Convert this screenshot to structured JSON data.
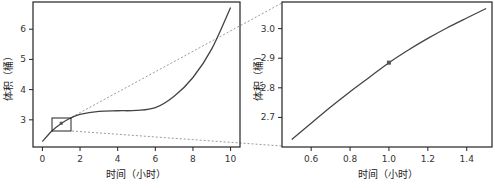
{
  "chart_data": [
    {
      "type": "line",
      "title": "",
      "xlabel": "时间（小时）",
      "ylabel": "体积（桶）",
      "xlim": [
        -0.5,
        10.5
      ],
      "ylim": [
        2.1,
        6.9
      ],
      "xticks": [
        0,
        2,
        4,
        6,
        8,
        10
      ],
      "yticks": [
        3,
        4,
        5,
        6
      ],
      "grid": false,
      "x": [
        0,
        0.5,
        1,
        1.5,
        2,
        3,
        4,
        5,
        6,
        7,
        8,
        9,
        10
      ],
      "y": [
        2.28,
        2.63,
        2.88,
        3.06,
        3.18,
        3.28,
        3.3,
        3.31,
        3.4,
        3.78,
        4.4,
        5.35,
        6.72
      ],
      "highlight_point": {
        "x": 1.0,
        "y": 2.885
      },
      "zoom_box": {
        "x0": 0.5,
        "x1": 1.5,
        "y0": 2.6,
        "y1": 3.08
      }
    },
    {
      "type": "line",
      "title": "",
      "xlabel": "时间（小时）",
      "ylabel": "体积（桶）",
      "xlim": [
        0.45,
        1.53
      ],
      "ylim": [
        2.6,
        3.09
      ],
      "xticks": [
        0.6,
        0.8,
        1.0,
        1.2,
        1.4
      ],
      "yticks": [
        2.7,
        2.8,
        2.9,
        3.0
      ],
      "grid": false,
      "x": [
        0.5,
        0.6,
        0.7,
        0.8,
        0.9,
        1.0,
        1.1,
        1.2,
        1.3,
        1.4,
        1.5
      ],
      "y": [
        2.625,
        2.68,
        2.735,
        2.787,
        2.836,
        2.885,
        2.928,
        2.967,
        3.003,
        3.036,
        3.068
      ],
      "highlight_point": {
        "x": 1.0,
        "y": 2.885
      }
    }
  ],
  "left": {
    "xlabel": "时间（小时）",
    "ylabel": "体积（桶）",
    "xticks": [
      "0",
      "2",
      "4",
      "6",
      "8",
      "10"
    ],
    "yticks": [
      "3",
      "4",
      "5",
      "6"
    ]
  },
  "right": {
    "xlabel": "时间（小时）",
    "ylabel": "体积（桶）",
    "xticks": [
      "0.6",
      "0.8",
      "1.0",
      "1.2",
      "1.4"
    ],
    "yticks": [
      "2.7",
      "2.8",
      "2.9",
      "3.0"
    ]
  },
  "colors": {
    "line": "#444444",
    "frame": "#222222",
    "connector": "#999999",
    "point": "#555555"
  }
}
